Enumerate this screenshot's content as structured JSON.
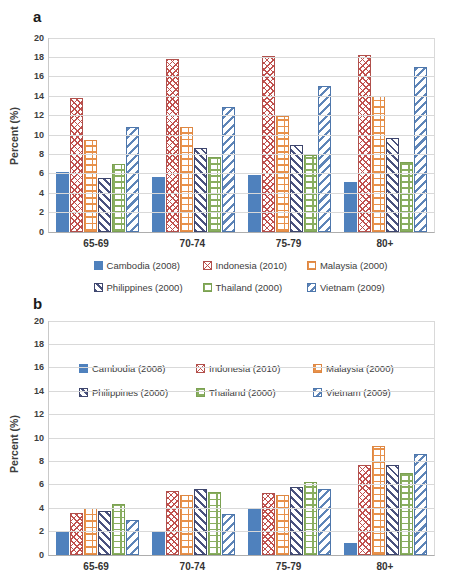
{
  "figure": {
    "panel_a_label": "a",
    "panel_b_label": "b",
    "ylabel": "Percent (%)"
  },
  "chart_data": [
    {
      "type": "bar",
      "panel": "a",
      "title": "",
      "xlabel": "",
      "ylabel": "Percent (%)",
      "ylim": [
        0,
        20
      ],
      "ytick_step": 2,
      "grid": true,
      "legend_position": "below",
      "categories": [
        "65-69",
        "70-74",
        "75-79",
        "80+"
      ],
      "series": [
        {
          "name": "Cambodia (2008)",
          "color": "#4F81BD",
          "pattern": "solid",
          "values": [
            6.2,
            5.7,
            5.9,
            5.2
          ]
        },
        {
          "name": "Indonesia (2010)",
          "color": "#C0504D",
          "pattern": "diagonal-crosshatch",
          "values": [
            13.8,
            17.8,
            18.1,
            18.2
          ]
        },
        {
          "name": "Malaysia (2000)",
          "color": "#E8914A",
          "pattern": "grid-ladder",
          "values": [
            9.5,
            10.8,
            12.0,
            14.0
          ]
        },
        {
          "name": "Philippines (2000)",
          "color": "#4A527E",
          "pattern": "diagonal-down",
          "values": [
            5.6,
            8.7,
            9.0,
            9.7
          ]
        },
        {
          "name": "Thailand (2000)",
          "color": "#89AE60",
          "pattern": "brick",
          "values": [
            7.0,
            7.7,
            7.9,
            7.2
          ]
        },
        {
          "name": "Vietnam (2009)",
          "color": "#5E85B8",
          "pattern": "diagonal-up",
          "values": [
            10.8,
            12.9,
            15.1,
            17.0
          ]
        }
      ]
    },
    {
      "type": "bar",
      "panel": "b",
      "title": "",
      "xlabel": "",
      "ylabel": "Percent (%)",
      "ylim": [
        0,
        20
      ],
      "ytick_step": 2,
      "grid": true,
      "legend_position": "inside-top",
      "categories": [
        "65-69",
        "70-74",
        "75-79",
        "80+"
      ],
      "series": [
        {
          "name": "Cambodia (2008)",
          "color": "#4F81BD",
          "pattern": "solid",
          "values": [
            2.0,
            2.0,
            3.9,
            1.0
          ]
        },
        {
          "name": "Indonesia (2010)",
          "color": "#C0504D",
          "pattern": "diagonal-crosshatch",
          "values": [
            3.6,
            5.5,
            5.3,
            7.7
          ]
        },
        {
          "name": "Malaysia (2000)",
          "color": "#E8914A",
          "pattern": "grid-ladder",
          "values": [
            4.0,
            5.1,
            5.1,
            9.3
          ]
        },
        {
          "name": "Philippines (2000)",
          "color": "#4A527E",
          "pattern": "diagonal-down",
          "values": [
            3.8,
            5.6,
            5.8,
            7.7
          ]
        },
        {
          "name": "Thailand (2000)",
          "color": "#89AE60",
          "pattern": "brick",
          "values": [
            4.4,
            5.4,
            6.2,
            7.0
          ]
        },
        {
          "name": "Vietnam (2009)",
          "color": "#5E85B8",
          "pattern": "diagonal-up",
          "values": [
            3.0,
            3.5,
            5.6,
            8.6
          ]
        }
      ]
    }
  ]
}
